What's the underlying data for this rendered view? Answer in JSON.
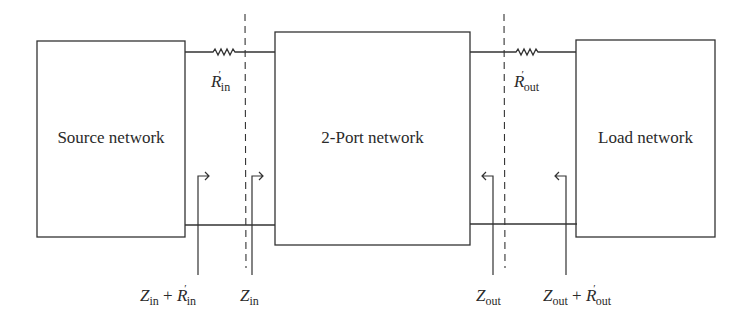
{
  "diagram": {
    "type": "impedance-matching-block-diagram",
    "blocks": [
      {
        "id": "source",
        "label": "Source network"
      },
      {
        "id": "twoport",
        "label": "2-Port network"
      },
      {
        "id": "load",
        "label": "Load network"
      }
    ],
    "resistors": [
      {
        "id": "r_in",
        "symbol": "R",
        "prime": "′",
        "subscript": "in"
      },
      {
        "id": "r_out",
        "symbol": "R",
        "prime": "′",
        "subscript": "out"
      }
    ],
    "reference_planes": [
      "input-plane",
      "output-plane"
    ],
    "impedance_labels": [
      {
        "id": "zin_plus_rin",
        "z": "Z",
        "z_sub": "in",
        "plus": "+",
        "r": "R",
        "r_prime": "′",
        "r_sub": "in",
        "arrow_direction": "right"
      },
      {
        "id": "zin",
        "z": "Z",
        "z_sub": "in",
        "arrow_direction": "right"
      },
      {
        "id": "zout",
        "z": "Z",
        "z_sub": "out",
        "arrow_direction": "left"
      },
      {
        "id": "zout_plus_rout",
        "z": "Z",
        "z_sub": "out",
        "plus": "+",
        "r": "R",
        "r_prime": "′",
        "r_sub": "out",
        "arrow_direction": "left"
      }
    ],
    "colors": {
      "line": "#333333",
      "background": "#ffffff"
    }
  }
}
